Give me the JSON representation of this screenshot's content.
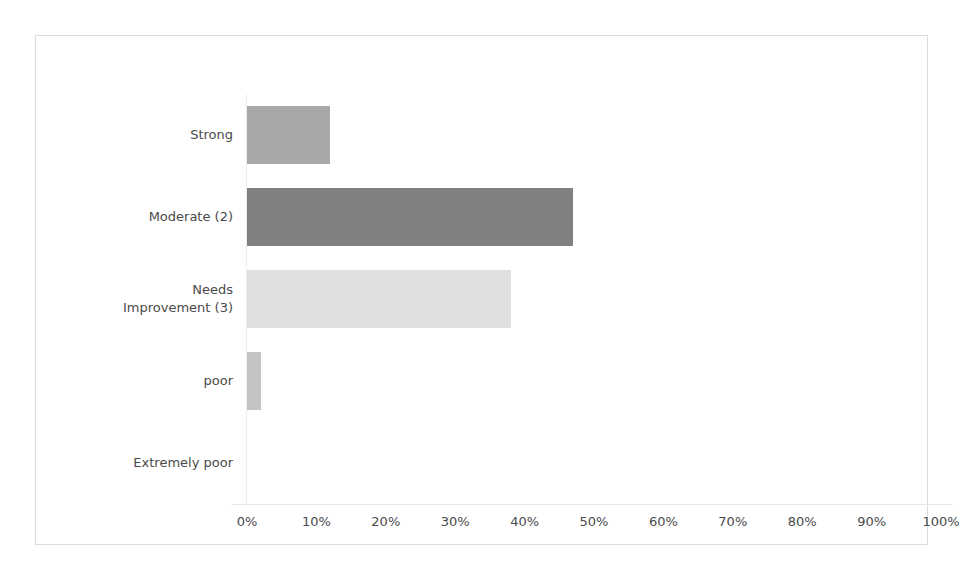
{
  "chart_data": {
    "type": "bar",
    "orientation": "horizontal",
    "title": "",
    "subtitle": "",
    "xlabel": "",
    "ylabel": "",
    "categories": [
      "Strong",
      "Moderate (2)",
      "Needs\nImprovement (3)",
      "poor",
      "Extremely poor"
    ],
    "values": [
      12,
      47,
      38,
      2,
      0
    ],
    "value_suffix": "%",
    "xlim": [
      0,
      100
    ],
    "tick_labels": [
      "0%",
      "10%",
      "20%",
      "30%",
      "40%",
      "50%",
      "60%",
      "70%",
      "80%",
      "90%",
      "100%"
    ],
    "tick_values": [
      0,
      10,
      20,
      30,
      40,
      50,
      60,
      70,
      80,
      90,
      100
    ],
    "grid": false,
    "legend": "none",
    "bar_colors": [
      "#a8a8a8",
      "#808080",
      "#e0e0e0",
      "#c4c4c4",
      "#c4c4c4"
    ],
    "series": [
      {
        "name": "Response share",
        "points": [
          {
            "category": "Strong",
            "value": 12,
            "color": "#a8a8a8"
          },
          {
            "category": "Moderate (2)",
            "value": 47,
            "color": "#808080"
          },
          {
            "category": "Needs\nImprovement (3)",
            "value": 38,
            "color": "#e0e0e0"
          },
          {
            "category": "poor",
            "value": 2,
            "color": "#c4c4c4"
          },
          {
            "category": "Extremely poor",
            "value": 0,
            "color": "#c4c4c4"
          }
        ]
      }
    ]
  },
  "figure": {
    "background": "#ffffff",
    "frame_color": "#dcdcdc",
    "axis_color": "#e8e8e8",
    "text_color": "#4a4a4a"
  }
}
